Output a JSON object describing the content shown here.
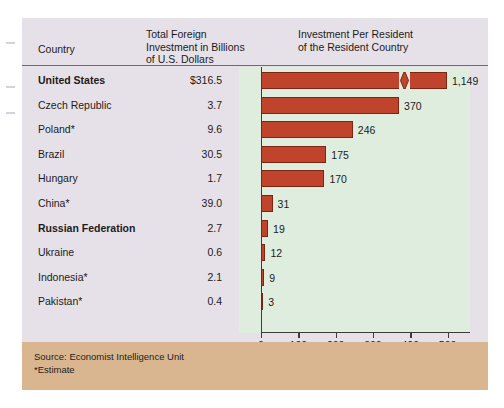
{
  "figure": {
    "headers": {
      "country": "Country",
      "total_investment": "Total Foreign\nInvestment in Billions\nof U.S. Dollars",
      "per_resident": "Investment Per Resident\nof the Resident Country"
    },
    "footer": {
      "source": "Source: Economist Intelligence Unit",
      "estimate_note": "*Estimate"
    },
    "colors": {
      "panel": "#e6e1e9",
      "plot_background": "#dfeddf",
      "bar": "#c0442c",
      "bar_border": "#7e2415",
      "footer_band": "#d9b68f",
      "text": "#1d1b20",
      "axis": "#3c3c3c"
    }
  },
  "chart_data": {
    "type": "bar",
    "orientation": "horizontal",
    "title": "Investment Per Resident of the Resident Country",
    "xlabel": "Dollars (in billions)",
    "ylabel": "",
    "xlim": [
      0,
      560
    ],
    "xticks": [
      0,
      100,
      200,
      300,
      400,
      500
    ],
    "xticklabels": [
      "0",
      "100",
      "200",
      "300",
      "400",
      "500"
    ],
    "grid": false,
    "legend": false,
    "axis_break": {
      "present": true,
      "series_index": 0,
      "note": "United States bar is drawn with a break mark; true value 1,149 exceeds axis range"
    },
    "categories": [
      "United States",
      "Czech Republic",
      "Poland*",
      "Brazil",
      "Hungary",
      "China*",
      "Russian Federation",
      "Ukraine",
      "Indonesia*",
      "Pakistan*"
    ],
    "values": [
      1149,
      370,
      246,
      175,
      170,
      31,
      19,
      12,
      9,
      3
    ],
    "value_labels": [
      "1,149",
      "370",
      "246",
      "175",
      "170",
      "31",
      "19",
      "12",
      "9",
      "3"
    ],
    "series": [
      {
        "name": "Investment Per Resident",
        "values": [
          1149,
          370,
          246,
          175,
          170,
          31,
          19,
          12,
          9,
          3
        ]
      },
      {
        "name": "Total Foreign Investment in Billions of U.S. Dollars",
        "values": [
          316.5,
          3.7,
          9.6,
          30.5,
          1.7,
          39.0,
          2.7,
          0.6,
          2.1,
          0.4
        ],
        "value_labels": [
          "$316.5",
          "3.7",
          "9.6",
          "30.5",
          "1.7",
          "39.0",
          "2.7",
          "0.6",
          "2.1",
          "0.4"
        ]
      }
    ]
  },
  "rows": [
    {
      "country": "United States",
      "total": "$316.5",
      "per_resident": "1,149",
      "bold": true
    },
    {
      "country": "Czech Republic",
      "total": "3.7",
      "per_resident": "370",
      "bold": false
    },
    {
      "country": "Poland*",
      "total": "9.6",
      "per_resident": "246",
      "bold": false
    },
    {
      "country": "Brazil",
      "total": "30.5",
      "per_resident": "175",
      "bold": false
    },
    {
      "country": "Hungary",
      "total": "1.7",
      "per_resident": "170",
      "bold": false
    },
    {
      "country": "China*",
      "total": "39.0",
      "per_resident": "31",
      "bold": false
    },
    {
      "country": "Russian Federation",
      "total": "2.7",
      "per_resident": "19",
      "bold": true
    },
    {
      "country": "Ukraine",
      "total": "0.6",
      "per_resident": "12",
      "bold": false
    },
    {
      "country": "Indonesia*",
      "total": "2.1",
      "per_resident": "9",
      "bold": false
    },
    {
      "country": "Pakistan*",
      "total": "0.4",
      "per_resident": "3",
      "bold": false
    }
  ]
}
